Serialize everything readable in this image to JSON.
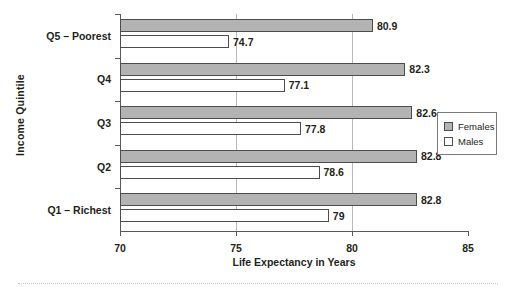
{
  "chart_data": {
    "type": "bar",
    "orientation": "horizontal",
    "title": "",
    "xlabel": "Life Expectancy in Years",
    "ylabel": "Income Quintile",
    "xlim": [
      70,
      85
    ],
    "xticks": [
      70,
      75,
      80,
      85
    ],
    "grid": "vertical-gridlines-at-75-and-80",
    "legend_position": "right",
    "categories": [
      "Q5 – Poorest",
      "Q4",
      "Q3",
      "Q2",
      "Q1 – Richest"
    ],
    "series": [
      {
        "name": "Females",
        "color": "#b3b3b3",
        "values": [
          80.9,
          82.3,
          82.6,
          82.8,
          82.8
        ],
        "labels": [
          "80.9",
          "82.3",
          "82.6",
          "82.8",
          "82.8"
        ]
      },
      {
        "name": "Males",
        "color": "#ffffff",
        "values": [
          74.7,
          77.1,
          77.8,
          78.6,
          79.0
        ],
        "labels": [
          "74.7",
          "77.1",
          "77.8",
          "78.6",
          "79"
        ]
      }
    ]
  },
  "axes": {
    "x_title": "Life Expectancy in Years",
    "y_title": "Income Quintile",
    "x_tick_labels": [
      "70",
      "75",
      "80",
      "85"
    ]
  },
  "legend": {
    "items": [
      {
        "label": "Females",
        "swatch": "females-swatch-icon"
      },
      {
        "label": "Males",
        "swatch": "males-swatch-icon"
      }
    ]
  }
}
